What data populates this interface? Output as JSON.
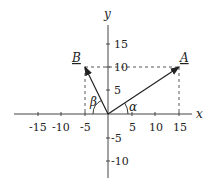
{
  "diagram": {
    "axes": {
      "x_label": "x",
      "y_label": "y",
      "x_ticks": [
        {
          "value": -15,
          "label": "-15"
        },
        {
          "value": -10,
          "label": "-10"
        },
        {
          "value": -5,
          "label": "-5"
        },
        {
          "value": 5,
          "label": "5"
        },
        {
          "value": 10,
          "label": "10"
        },
        {
          "value": 15,
          "label": "15"
        }
      ],
      "y_ticks": [
        {
          "value": 15,
          "label": "15"
        },
        {
          "value": 10,
          "label": "10"
        },
        {
          "value": 5,
          "label": "5"
        },
        {
          "value": -5,
          "label": "-5"
        },
        {
          "value": -10,
          "label": "-10"
        }
      ]
    },
    "vectors": [
      {
        "name": "A",
        "x": 15,
        "y": 10
      },
      {
        "name": "B",
        "x": -5,
        "y": 10
      }
    ],
    "angles": [
      {
        "name": "alpha",
        "symbol": "α"
      },
      {
        "name": "beta",
        "symbol": "β"
      }
    ],
    "colors": {
      "ink": "#222222",
      "axis": "#444444"
    }
  }
}
